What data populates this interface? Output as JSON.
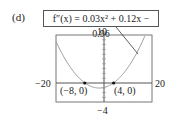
{
  "panel_label": "(d)",
  "equation": "f″(x) = 0.03x² + 0.12x − 0.96",
  "chart_data": {
    "type": "line",
    "function": "0.03x^2 + 0.12x - 0.96",
    "xlim": [
      -20,
      20
    ],
    "ylim": [
      -4,
      10
    ],
    "tick_labels": {
      "xmin": "−20",
      "xmax": "20",
      "ymax": "10",
      "ymin": "−4"
    },
    "x": [
      -20,
      -16,
      -12,
      -8,
      -4,
      -2,
      0,
      4,
      8,
      12,
      16
    ],
    "y": [
      8.64,
      4.8,
      1.92,
      0,
      -0.96,
      -1.08,
      -0.96,
      0,
      1.92,
      4.8,
      8.64
    ],
    "points": [
      {
        "label": "(−8, 0)",
        "x": -8,
        "y": 0
      },
      {
        "label": "(4, 0)",
        "x": 4,
        "y": 0
      }
    ],
    "grid": false
  }
}
